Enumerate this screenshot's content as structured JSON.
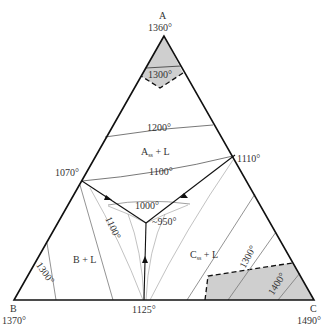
{
  "diagram": {
    "type": "ternary-phase-diagram",
    "vertices": {
      "A": {
        "label": "A",
        "temp": "1360°"
      },
      "B": {
        "label": "B",
        "temp": "1370°"
      },
      "C": {
        "label": "C",
        "temp": "1490°"
      }
    },
    "binary_eutectics": {
      "AB": "1070°",
      "AC": "1110°",
      "BC": "1125°"
    },
    "ternary_eutectic": "~950°",
    "isotherms": {
      "a_1300": "1300°",
      "a_1200": "1200°",
      "a_1100": "1100°",
      "center_1000": "1000°",
      "b_1100": "1100°",
      "b_1300": "1300°",
      "c_1300": "1300°",
      "c_1400": "1400°"
    },
    "regions": {
      "A": {
        "main": "A",
        "sub": "ss",
        "rest": " + L"
      },
      "B": {
        "text": "B + L"
      },
      "C": {
        "main": "C",
        "sub": "ss",
        "rest": " + L"
      }
    },
    "colors": {
      "outline": "#111111",
      "isotherm": "#555555",
      "shaded": "#cfcfcf"
    }
  }
}
